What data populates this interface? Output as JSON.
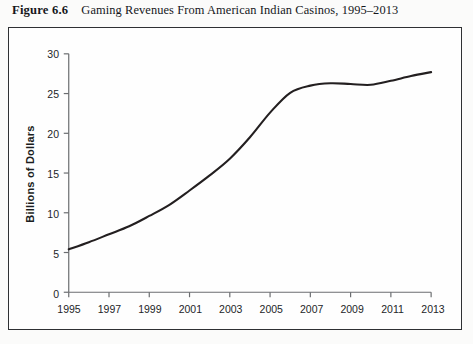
{
  "caption": {
    "figure_number": "Figure 6.6",
    "title": "Gaming Revenues From American Indian Casinos, 1995–2013"
  },
  "colors": {
    "line": "#231f20",
    "axis": "#6b6d70",
    "tick_text": "#232528",
    "page_background": "#fbfbfa",
    "plot_background": "#fefefe",
    "frame_border": "#2e3033"
  },
  "chart_data": {
    "type": "line",
    "title": "Gaming Revenues From American Indian Casinos, 1995–2013",
    "xlabel": "",
    "ylabel": "Billions of Dollars",
    "xlim": [
      1995,
      2013
    ],
    "ylim": [
      0,
      30
    ],
    "grid": false,
    "legend": "none",
    "ytick_labels": [
      "0",
      "5",
      "10",
      "15",
      "20",
      "25",
      "30"
    ],
    "yticks": [
      0,
      5,
      10,
      15,
      20,
      25,
      30
    ],
    "xtick_labels": [
      "1995",
      "1997",
      "1999",
      "2001",
      "2003",
      "2005",
      "2007",
      "2009",
      "2011",
      "2013"
    ],
    "xticks": [
      1995,
      1997,
      1999,
      2001,
      2003,
      2005,
      2007,
      2009,
      2011,
      2013
    ],
    "x": [
      1995,
      1996,
      1997,
      1998,
      1999,
      2000,
      2001,
      2002,
      2003,
      2004,
      2005,
      2006,
      2007,
      2008,
      2009,
      2010,
      2011,
      2012,
      2013
    ],
    "series": [
      {
        "name": "Gaming revenues",
        "values": [
          5.4,
          6.3,
          7.3,
          8.3,
          9.6,
          11.0,
          12.8,
          14.7,
          16.8,
          19.5,
          22.6,
          25.1,
          26.0,
          26.3,
          26.2,
          26.1,
          26.6,
          27.2,
          27.7
        ]
      }
    ]
  }
}
